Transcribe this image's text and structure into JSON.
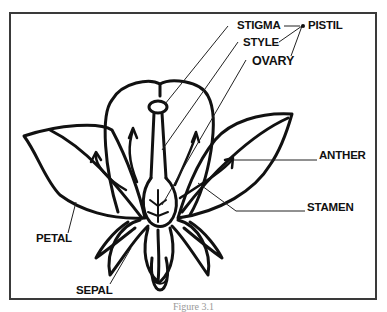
{
  "figure": {
    "caption": "Figure 3.1",
    "labels": {
      "stigma": "STIGMA",
      "style": "STYLE",
      "ovary": "OVARY",
      "pistil": "PISTIL",
      "anther": "ANTHER",
      "stamen": "STAMEN",
      "petal": "PETAL",
      "sepal": "SEPAL"
    },
    "colors": {
      "line": "#111111",
      "border": "#3a3a3a",
      "background": "#ffffff"
    }
  }
}
